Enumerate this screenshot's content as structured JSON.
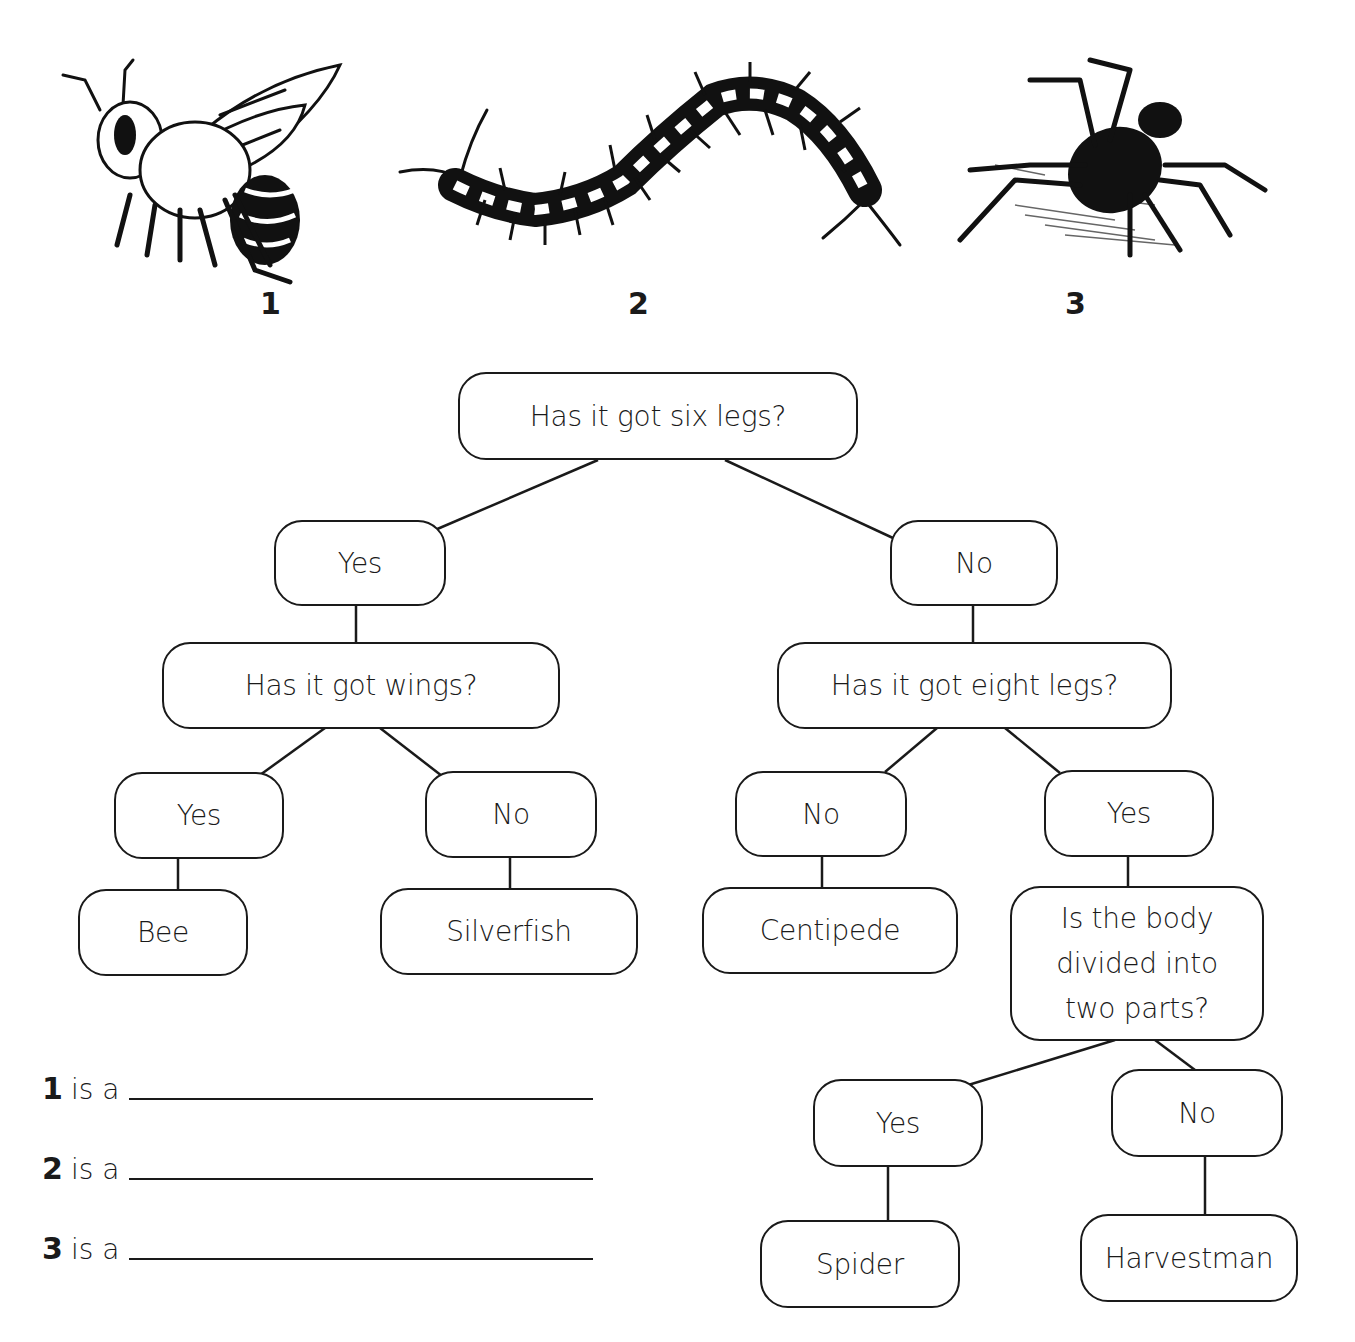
{
  "illustrations": [
    {
      "number": "1",
      "icon": "bee-illustration"
    },
    {
      "number": "2",
      "icon": "centipede-illustration"
    },
    {
      "number": "3",
      "icon": "spider-illustration"
    }
  ],
  "key": {
    "root": "Has it got six legs?",
    "yes_branch": {
      "label": "Yes",
      "question": "Has it got wings?",
      "yes": {
        "label": "Yes",
        "result": "Bee"
      },
      "no": {
        "label": "No",
        "result": "Silverfish"
      }
    },
    "no_branch": {
      "label": "No",
      "question": "Has it got eight legs?",
      "no": {
        "label": "No",
        "result": "Centipede"
      },
      "yes": {
        "label": "Yes",
        "question_lines": [
          "Is the body",
          "divided into",
          "two parts?"
        ],
        "yes": {
          "label": "Yes",
          "result": "Spider"
        },
        "no": {
          "label": "No",
          "result": "Harvestman"
        }
      }
    }
  },
  "answers": [
    {
      "number": "1",
      "text": "is a",
      "value": ""
    },
    {
      "number": "2",
      "text": "is a",
      "value": ""
    },
    {
      "number": "3",
      "text": "is a",
      "value": ""
    }
  ]
}
